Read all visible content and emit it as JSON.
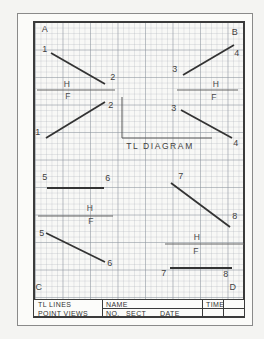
{
  "colors": {
    "object_line": "#333333",
    "fold_line": "#636363",
    "leader_line": "#555555",
    "border": "#3b3b3b"
  },
  "diagram": {
    "caption": "TL DIAGRAM",
    "labels": [
      {
        "text": "A",
        "x": 45,
        "y": 29,
        "kind": "corner-label"
      },
      {
        "text": "B",
        "x": 235,
        "y": 32,
        "kind": "corner-label"
      },
      {
        "text": "C",
        "x": 39,
        "y": 287,
        "kind": "corner-label"
      },
      {
        "text": "D",
        "x": 233,
        "y": 287,
        "kind": "corner-label"
      },
      {
        "text": "1",
        "x": 45,
        "y": 49,
        "kind": "point-label"
      },
      {
        "text": "2",
        "x": 113,
        "y": 77,
        "kind": "point-label"
      },
      {
        "text": "H",
        "x": 67,
        "y": 84,
        "kind": "fold-label"
      },
      {
        "text": "F",
        "x": 68,
        "y": 96,
        "kind": "fold-label"
      },
      {
        "text": "2",
        "x": 111,
        "y": 105,
        "kind": "point-label"
      },
      {
        "text": "1",
        "x": 38,
        "y": 132,
        "kind": "point-label"
      },
      {
        "text": "3",
        "x": 175,
        "y": 69,
        "kind": "point-label"
      },
      {
        "text": "4",
        "x": 237,
        "y": 53,
        "kind": "point-label"
      },
      {
        "text": "H",
        "x": 216,
        "y": 84,
        "kind": "fold-label"
      },
      {
        "text": "F",
        "x": 214,
        "y": 97,
        "kind": "fold-label"
      },
      {
        "text": "3",
        "x": 174,
        "y": 108,
        "kind": "point-label"
      },
      {
        "text": "4",
        "x": 236,
        "y": 143,
        "kind": "point-label"
      },
      {
        "text": "5",
        "x": 45,
        "y": 177,
        "kind": "point-label"
      },
      {
        "text": "6",
        "x": 108,
        "y": 178,
        "kind": "point-label"
      },
      {
        "text": "H",
        "x": 90,
        "y": 208,
        "kind": "fold-label"
      },
      {
        "text": "F",
        "x": 91,
        "y": 221,
        "kind": "fold-label"
      },
      {
        "text": "5",
        "x": 42,
        "y": 233,
        "kind": "point-label"
      },
      {
        "text": "6",
        "x": 110,
        "y": 263,
        "kind": "point-label"
      },
      {
        "text": "7",
        "x": 181,
        "y": 176,
        "kind": "point-label"
      },
      {
        "text": "8",
        "x": 235,
        "y": 216,
        "kind": "point-label"
      },
      {
        "text": "H",
        "x": 197,
        "y": 237,
        "kind": "fold-label"
      },
      {
        "text": "F",
        "x": 196,
        "y": 251,
        "kind": "fold-label"
      },
      {
        "text": "7",
        "x": 164,
        "y": 273,
        "kind": "point-label"
      },
      {
        "text": "8",
        "x": 226,
        "y": 274,
        "kind": "point-label"
      }
    ],
    "object_lines": [
      {
        "name": "line-1-2-top",
        "x1": 51,
        "y1": 53,
        "x2": 105,
        "y2": 84
      },
      {
        "name": "line-3-4-top",
        "x1": 183,
        "y1": 75,
        "x2": 234,
        "y2": 45
      },
      {
        "name": "line-1-2-front",
        "x1": 46,
        "y1": 138,
        "x2": 105,
        "y2": 102
      },
      {
        "name": "line-3-4-front",
        "x1": 181,
        "y1": 110,
        "x2": 232,
        "y2": 138
      },
      {
        "name": "line-5-6-top",
        "x1": 47,
        "y1": 188,
        "x2": 104,
        "y2": 188
      },
      {
        "name": "line-5-6-front",
        "x1": 46,
        "y1": 233,
        "x2": 105,
        "y2": 262
      },
      {
        "name": "line-7-8-top",
        "x1": 171,
        "y1": 183,
        "x2": 230,
        "y2": 227
      },
      {
        "name": "line-7-8-front",
        "x1": 170,
        "y1": 268,
        "x2": 232,
        "y2": 268
      }
    ],
    "fold_lines": [
      {
        "name": "hf-fold-upper-left",
        "x1": 37,
        "y1": 90,
        "x2": 115,
        "y2": 90
      },
      {
        "name": "hf-fold-upper-right",
        "x1": 177,
        "y1": 90,
        "x2": 238,
        "y2": 90
      },
      {
        "name": "hf-fold-lower-left",
        "x1": 38,
        "y1": 216,
        "x2": 113,
        "y2": 216
      },
      {
        "name": "hf-fold-lower-right",
        "x1": 165,
        "y1": 244,
        "x2": 244,
        "y2": 244
      }
    ],
    "caption_leader_points": "122,97 122,138 212,138"
  },
  "title_block": {
    "project_line1": "TL LINES",
    "project_line2": "POINT VIEWS",
    "name_label": "NAME",
    "no_label": "NO.",
    "sect_label": "SECT",
    "date_label": "DATE",
    "time_label": "TIME"
  }
}
